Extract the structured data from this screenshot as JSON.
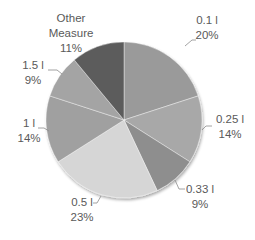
{
  "chart_data": {
    "type": "pie",
    "title": "",
    "start": "top",
    "direction": "clockwise",
    "categories": [
      "0.1 l",
      "0.25 l",
      "0.33 l",
      "0.5 l",
      "1 l",
      "1.5 l",
      "Other Measure"
    ],
    "values": [
      20,
      14,
      9,
      23,
      14,
      9,
      11
    ],
    "value_labels": [
      "20%",
      "14%",
      "9%",
      "23%",
      "14%",
      "9%",
      "11%"
    ],
    "colors": [
      "#9a9a9a",
      "#a8a8a8",
      "#8e8e8e",
      "#d6d6d6",
      "#a0a0a0",
      "#a4a4a4",
      "#5c5c5c"
    ],
    "label_name_lines": [
      [
        "0.1 l"
      ],
      [
        "0.25 l"
      ],
      [
        "0.33 l"
      ],
      [
        "0.5 l"
      ],
      [
        "1 l"
      ],
      [
        "1.5 l"
      ],
      [
        "Other",
        "Measure"
      ]
    ],
    "legend": "none"
  }
}
